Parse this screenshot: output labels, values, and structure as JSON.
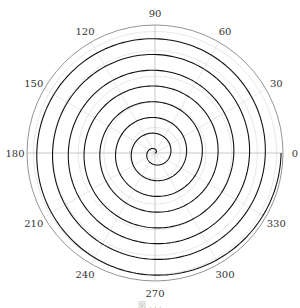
{
  "chart_data": {
    "type": "line",
    "subtype": "polar",
    "title": "",
    "curve": "archimedean spiral r = theta",
    "turns": 8,
    "theta_range_deg": [
      0,
      2880
    ],
    "r_range": [
      0,
      1
    ],
    "angular_ticks": [
      "0",
      "30",
      "60",
      "90",
      "120",
      "150",
      "180",
      "210",
      "240",
      "270",
      "300",
      "330"
    ],
    "angular_tick_values_deg": [
      0,
      30,
      60,
      90,
      120,
      150,
      180,
      210,
      240,
      270,
      300,
      330
    ],
    "radial_gridlines": [
      0.2,
      0.4,
      0.6,
      0.8,
      0.95
    ],
    "grid": true,
    "series_color": "#111111",
    "grid_color": "#d8d8d8",
    "outer_circle_color": "#888888"
  },
  "caption": "図 . . . "
}
